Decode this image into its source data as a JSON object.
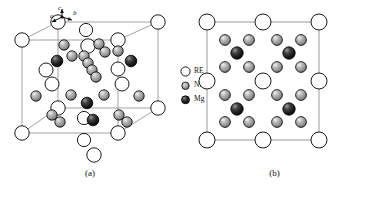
{
  "figure": {
    "type": "crystal-structure-diagram",
    "background": "#ffffff"
  },
  "legend": {
    "title": "",
    "items": [
      {
        "label": "RE",
        "icon": "open-circle-atom-icon",
        "fill": "#ffffff",
        "stroke": "#000000",
        "radius": 5.0
      },
      {
        "label": "Ni",
        "icon": "gray-circle-atom-icon",
        "fill": "#9c9c9c",
        "stroke": "#000000",
        "radius": 3.4
      },
      {
        "label": "Mg",
        "icon": "dark-circle-atom-icon",
        "fill": "#1c1c1c",
        "stroke": "#000000",
        "radius": 3.8
      }
    ]
  },
  "panel_a": {
    "caption": "(a)",
    "axes": {
      "a": "a",
      "b": "b",
      "c": "c"
    },
    "cell": {
      "front": [
        [
          22,
          133
        ],
        [
          118,
          133
        ],
        [
          118,
          40
        ],
        [
          22,
          40
        ]
      ],
      "back": [
        [
          58,
          108
        ],
        [
          158,
          108
        ],
        [
          158,
          22
        ],
        [
          58,
          22
        ]
      ]
    },
    "atoms": [
      {
        "el": "RE",
        "x": 22,
        "y": 40,
        "r": 7.2
      },
      {
        "el": "RE",
        "x": 22,
        "y": 133,
        "r": 7.2
      },
      {
        "el": "RE",
        "x": 118,
        "y": 40,
        "r": 7.2
      },
      {
        "el": "RE",
        "x": 118,
        "y": 133,
        "r": 7.2
      },
      {
        "el": "RE",
        "x": 58,
        "y": 22,
        "r": 7.2
      },
      {
        "el": "RE",
        "x": 158,
        "y": 22,
        "r": 7.2
      },
      {
        "el": "RE",
        "x": 158,
        "y": 108,
        "r": 7.2
      },
      {
        "el": "RE",
        "x": 58,
        "y": 108,
        "r": 7.2
      },
      {
        "el": "RE",
        "x": 88,
        "y": 46,
        "r": 7.2
      },
      {
        "el": "RE",
        "x": 94,
        "y": 155,
        "r": 7.2
      },
      {
        "el": "RE",
        "x": 84,
        "y": 140,
        "r": 6.6
      },
      {
        "el": "RE",
        "x": 84,
        "y": 118,
        "r": 6.6
      },
      {
        "el": "RE",
        "x": 86,
        "y": 30,
        "r": 6.6
      },
      {
        "el": "RE",
        "x": 52,
        "y": 84,
        "r": 7.0
      },
      {
        "el": "RE",
        "x": 46,
        "y": 70,
        "r": 7.0
      },
      {
        "el": "RE",
        "x": 122,
        "y": 84,
        "r": 7.0
      },
      {
        "el": "RE",
        "x": 118,
        "y": 69,
        "r": 7.0
      },
      {
        "el": "Ni",
        "x": 64,
        "y": 45,
        "r": 5.2
      },
      {
        "el": "Ni",
        "x": 99,
        "y": 44,
        "r": 5.2
      },
      {
        "el": "Ni",
        "x": 105,
        "y": 52,
        "r": 5.2
      },
      {
        "el": "Ni",
        "x": 118,
        "y": 51,
        "r": 5.2
      },
      {
        "el": "Ni",
        "x": 72,
        "y": 56,
        "r": 5.2
      },
      {
        "el": "Ni",
        "x": 84,
        "y": 56,
        "r": 5.2
      },
      {
        "el": "Ni",
        "x": 88,
        "y": 63,
        "r": 5.2
      },
      {
        "el": "Ni",
        "x": 92,
        "y": 70,
        "r": 5.2
      },
      {
        "el": "Ni",
        "x": 96,
        "y": 77,
        "r": 5.2
      },
      {
        "el": "Ni",
        "x": 71,
        "y": 95,
        "r": 5.2
      },
      {
        "el": "Ni",
        "x": 36,
        "y": 96,
        "r": 5.2
      },
      {
        "el": "Ni",
        "x": 104,
        "y": 95,
        "r": 5.2
      },
      {
        "el": "Ni",
        "x": 139,
        "y": 96,
        "r": 5.2
      },
      {
        "el": "Ni",
        "x": 52,
        "y": 115,
        "r": 5.2
      },
      {
        "el": "Ni",
        "x": 60,
        "y": 122,
        "r": 5.2
      },
      {
        "el": "Ni",
        "x": 119,
        "y": 115,
        "r": 5.2
      },
      {
        "el": "Ni",
        "x": 127,
        "y": 122,
        "r": 5.2
      },
      {
        "el": "Mg",
        "x": 57,
        "y": 61,
        "r": 5.8
      },
      {
        "el": "Mg",
        "x": 131,
        "y": 61,
        "r": 5.8
      },
      {
        "el": "Mg",
        "x": 87,
        "y": 103,
        "r": 5.8
      },
      {
        "el": "Mg",
        "x": 93,
        "y": 120,
        "r": 5.8
      }
    ]
  },
  "panel_b": {
    "caption": "(b)",
    "cell": {
      "left": 27,
      "top": 22,
      "width": 112,
      "height": 118
    },
    "atoms": [
      {
        "el": "RE",
        "x": 27,
        "y": 22,
        "r": 8.0
      },
      {
        "el": "RE",
        "x": 83,
        "y": 22,
        "r": 8.0
      },
      {
        "el": "RE",
        "x": 139,
        "y": 22,
        "r": 8.0
      },
      {
        "el": "RE",
        "x": 27,
        "y": 81,
        "r": 8.0
      },
      {
        "el": "RE",
        "x": 83,
        "y": 81,
        "r": 8.0
      },
      {
        "el": "RE",
        "x": 139,
        "y": 81,
        "r": 8.0
      },
      {
        "el": "RE",
        "x": 27,
        "y": 140,
        "r": 8.0
      },
      {
        "el": "RE",
        "x": 83,
        "y": 140,
        "r": 8.0
      },
      {
        "el": "RE",
        "x": 139,
        "y": 140,
        "r": 8.0
      },
      {
        "el": "Ni",
        "x": 45,
        "y": 40,
        "r": 5.4
      },
      {
        "el": "Ni",
        "x": 69,
        "y": 40,
        "r": 5.4
      },
      {
        "el": "Ni",
        "x": 97,
        "y": 40,
        "r": 5.4
      },
      {
        "el": "Ni",
        "x": 121,
        "y": 40,
        "r": 5.4
      },
      {
        "el": "Ni",
        "x": 45,
        "y": 67,
        "r": 5.4
      },
      {
        "el": "Ni",
        "x": 69,
        "y": 67,
        "r": 5.4
      },
      {
        "el": "Ni",
        "x": 97,
        "y": 67,
        "r": 5.4
      },
      {
        "el": "Ni",
        "x": 121,
        "y": 67,
        "r": 5.4
      },
      {
        "el": "Ni",
        "x": 45,
        "y": 95,
        "r": 5.4
      },
      {
        "el": "Ni",
        "x": 69,
        "y": 95,
        "r": 5.4
      },
      {
        "el": "Ni",
        "x": 97,
        "y": 95,
        "r": 5.4
      },
      {
        "el": "Ni",
        "x": 121,
        "y": 95,
        "r": 5.4
      },
      {
        "el": "Ni",
        "x": 45,
        "y": 122,
        "r": 5.4
      },
      {
        "el": "Ni",
        "x": 69,
        "y": 122,
        "r": 5.4
      },
      {
        "el": "Ni",
        "x": 97,
        "y": 122,
        "r": 5.4
      },
      {
        "el": "Ni",
        "x": 121,
        "y": 122,
        "r": 5.4
      },
      {
        "el": "Mg",
        "x": 57,
        "y": 53,
        "r": 6.2
      },
      {
        "el": "Mg",
        "x": 109,
        "y": 53,
        "r": 6.2
      },
      {
        "el": "Mg",
        "x": 57,
        "y": 109,
        "r": 6.2
      },
      {
        "el": "Mg",
        "x": 109,
        "y": 109,
        "r": 6.2
      }
    ]
  }
}
